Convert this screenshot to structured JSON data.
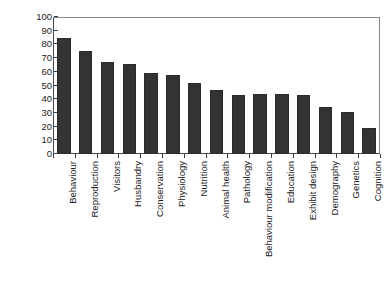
{
  "chart_data": {
    "type": "bar",
    "title": "",
    "subtitle": "",
    "xlabel": "",
    "ylabel": "% of zoos",
    "ylim": [
      0,
      100
    ],
    "ytick_step": 10,
    "yticks": [
      100,
      90,
      80,
      70,
      60,
      50,
      40,
      30,
      20,
      10,
      0
    ],
    "grid": false,
    "legend": false,
    "legend_position": "none",
    "bar_color": "#333333",
    "categories": [
      "Behaviour",
      "Reproduction",
      "Visitors",
      "Husbandry",
      "Conservation",
      "Physiology",
      "Nutrition",
      "Animal health",
      "Pathology",
      "Behaviour modification",
      "Education",
      "Exhibit design",
      "Demography",
      "Genetics",
      "Cognition"
    ],
    "values": [
      85,
      75.5,
      67.5,
      66,
      59.5,
      58,
      51.5,
      46.5,
      43,
      43.5,
      43.5,
      43,
      34,
      31,
      19
    ]
  },
  "axes": {
    "y_title": "% of zoos"
  }
}
